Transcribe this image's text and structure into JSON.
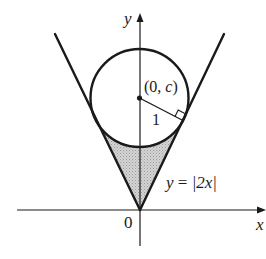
{
  "figure": {
    "type": "diagram",
    "axes": {
      "x_label": "x",
      "y_label": "y",
      "origin_label": "0"
    },
    "curve_label": {
      "prefix": "y",
      "equals": " = ",
      "expression": "|2x|"
    },
    "circle": {
      "center_label_open": "(0, ",
      "center_label_var": "c",
      "center_label_close": ")",
      "radius_label": "1"
    },
    "colors": {
      "stroke": "#1a1a1a",
      "shade": "#c8c8c8"
    }
  }
}
